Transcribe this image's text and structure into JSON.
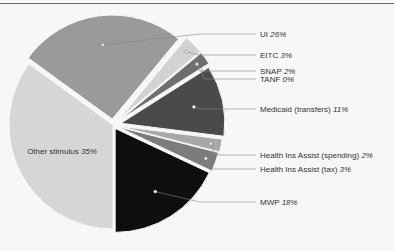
{
  "chart_data": {
    "type": "pie",
    "title": "",
    "exploded": true,
    "center": [
      113,
      125
    ],
    "radius": 104,
    "start_angle_deg": -54,
    "slices": [
      {
        "key": "ui",
        "label": "UI",
        "pct_label": "26%",
        "value": 26,
        "color": "#9a9a9a",
        "explode": 6,
        "marker": "light",
        "label_y": 34
      },
      {
        "key": "eitc",
        "label": "EITC",
        "pct_label": "3%",
        "value": 3,
        "color": "#d2d2d2",
        "explode": 10,
        "marker": "light",
        "label_y": 55
      },
      {
        "key": "snap",
        "label": "SNAP",
        "pct_label": "2%",
        "value": 2,
        "color": "#6e6e6e",
        "explode": 10,
        "marker": "dark",
        "label_y": 71
      },
      {
        "key": "tanf",
        "label": "TANF",
        "pct_label": "0%",
        "value": 0,
        "color": "#e0e0e0",
        "explode": 10,
        "marker": "light",
        "label_y": 79
      },
      {
        "key": "medicaid",
        "label": "Medicaid (transfers)",
        "pct_label": "11%",
        "value": 11,
        "color": "#4a4a4a",
        "explode": 8,
        "marker": "dark",
        "label_y": 109
      },
      {
        "key": "hia_spend",
        "label": "Health Ins Assist (spending)",
        "pct_label": "2%",
        "value": 2,
        "color": "#a8a8a8",
        "explode": 6,
        "marker": "light",
        "label_y": 155
      },
      {
        "key": "hia_tax",
        "label": "Health Ins Assist (tax)",
        "pct_label": "3%",
        "value": 3,
        "color": "#7c7c7c",
        "explode": 5,
        "marker": "dark",
        "label_y": 169
      },
      {
        "key": "mwp",
        "label": "MWP",
        "pct_label": "18%",
        "value": 18,
        "color": "#0e0e0e",
        "explode": 4,
        "marker": "dark",
        "label_y": 202
      },
      {
        "key": "other",
        "label": "Other stimulus",
        "pct_label": "35%",
        "value": 35,
        "color": "#d6d6d6",
        "explode": 0,
        "marker": "none",
        "inside": true
      }
    ],
    "legend_position": "right",
    "label_x": 260
  }
}
